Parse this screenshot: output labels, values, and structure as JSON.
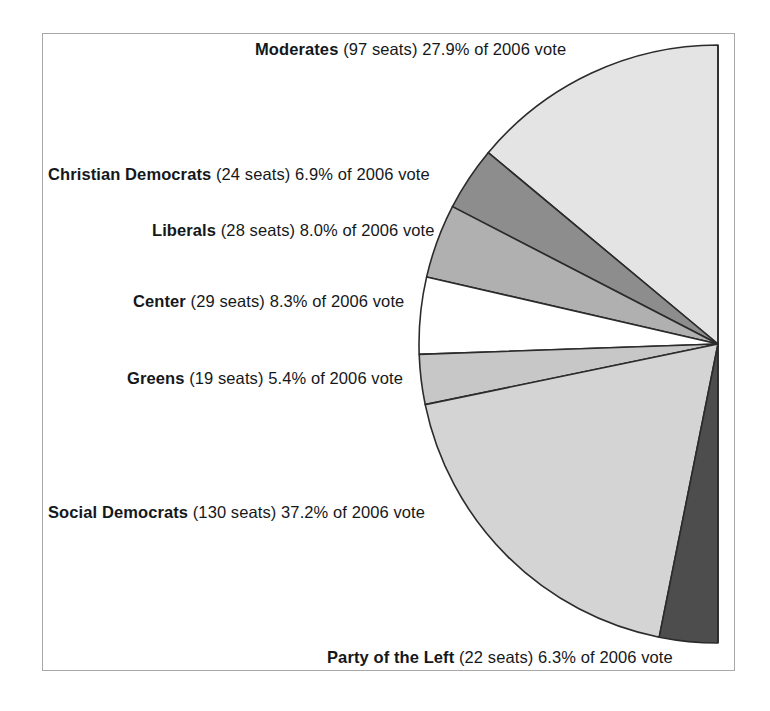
{
  "figure": {
    "background_color": "#ffffff",
    "frame_color": "#a8a8a8",
    "outline_color": "#2b2b2b"
  },
  "chart_data": {
    "type": "pie",
    "title": "",
    "subtitle": "",
    "xlabel": "",
    "ylabel": "",
    "legend_position": "inline-labels-left",
    "grid": false,
    "note": "Semicircular (half-disc) pie; flat edge vertical on the right, slices sweep counter-clockwise from 12 o'clock",
    "center_x": 718,
    "center_y": 344,
    "radius": 299,
    "start_angle_deg": 0,
    "total_seats": 349,
    "vote_year": "2006",
    "categories": [
      "Moderates",
      "Christian Democrats",
      "Liberals",
      "Center",
      "Greens",
      "Social Democrats",
      "Party of the Left"
    ],
    "values": [
      27.9,
      6.9,
      8.0,
      8.3,
      5.4,
      37.2,
      6.3
    ],
    "seats": [
      97,
      24,
      28,
      29,
      19,
      130,
      22
    ],
    "slices": [
      {
        "party": "Moderates",
        "seats": 97,
        "seats_text": "(97 seats)",
        "percent": 27.9,
        "percent_text": "27.9% of 2006 vote",
        "label_full": "Moderates (97 seats) 27.9% of 2006 vote",
        "color": "#e4e4e4"
      },
      {
        "party": "Christian Democrats",
        "seats": 24,
        "seats_text": "(24 seats)",
        "percent": 6.9,
        "percent_text": "6.9% of 2006 vote",
        "label_full": "Christian Democrats (24 seats) 6.9% of 2006 vote",
        "color": "#8d8d8d"
      },
      {
        "party": "Liberals",
        "seats": 28,
        "seats_text": "(28 seats)",
        "percent": 8.0,
        "percent_text": "8.0% of 2006 vote",
        "label_full": "Liberals (28 seats) 8.0% of 2006 vote",
        "color": "#b0b0b0"
      },
      {
        "party": "Center",
        "seats": 29,
        "seats_text": "(29 seats)",
        "percent": 8.3,
        "percent_text": "8.3% of 2006 vote",
        "label_full": "Center (29 seats) 8.3% of 2006 vote",
        "color": "#ffffff"
      },
      {
        "party": "Greens",
        "seats": 19,
        "seats_text": "(19 seats)",
        "percent": 5.4,
        "percent_text": "5.4% of 2006 vote",
        "label_full": "Greens (19 seats) 5.4% of 2006 vote",
        "color": "#c7c7c7"
      },
      {
        "party": "Social Democrats",
        "seats": 130,
        "seats_text": "(130 seats)",
        "percent": 37.2,
        "percent_text": "37.2% of 2006 vote",
        "label_full": "Social Democrats (130 seats) 37.2% of 2006 vote",
        "color": "#d4d4d4"
      },
      {
        "party": "Party of the Left",
        "seats": 22,
        "seats_text": "(22 seats)",
        "percent": 6.3,
        "percent_text": "6.3% of 2006 vote",
        "label_full": "Party of the Left (22 seats) 6.3% of 2006 vote",
        "color": "#4d4d4d"
      }
    ]
  }
}
